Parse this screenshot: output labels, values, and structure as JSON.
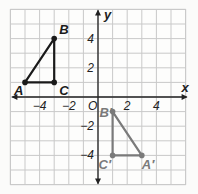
{
  "diagram": {
    "title": "",
    "axes": {
      "x_label": "x",
      "y_label": "y",
      "origin_label": "O",
      "x_ticks": [
        {
          "v": -4,
          "t": "−4"
        },
        {
          "v": -2,
          "t": "−2"
        },
        {
          "v": 2,
          "t": "2"
        },
        {
          "v": 4,
          "t": "4"
        }
      ],
      "y_ticks": [
        {
          "v": 4,
          "t": "4"
        },
        {
          "v": 2,
          "t": "2"
        },
        {
          "v": -2,
          "t": "−2"
        },
        {
          "v": -4,
          "t": "−4"
        }
      ]
    },
    "grid_range": [
      -6,
      6
    ],
    "triangles": [
      {
        "name": "ABC",
        "color": "#1a1a1a",
        "points": [
          {
            "label": "A",
            "x": -5,
            "y": 1
          },
          {
            "label": "B",
            "x": -3,
            "y": 4
          },
          {
            "label": "C",
            "x": -3,
            "y": 1
          }
        ]
      },
      {
        "name": "A'B'C'",
        "color": "#7a7a7a",
        "points": [
          {
            "label": "A′",
            "x": 3,
            "y": -4
          },
          {
            "label": "B′",
            "x": 1,
            "y": -1
          },
          {
            "label": "C′",
            "x": 1,
            "y": -4
          }
        ]
      }
    ]
  }
}
